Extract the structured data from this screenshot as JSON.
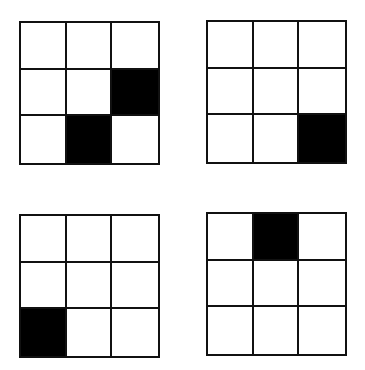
{
  "diagram": {
    "colors": {
      "filled": "#000000",
      "empty": "#ffffff",
      "line": "#111111"
    },
    "grids": [
      {
        "id": "top-left",
        "rows": 3,
        "cols": 3,
        "cells": [
          [
            0,
            0,
            0
          ],
          [
            0,
            0,
            1
          ],
          [
            0,
            1,
            0
          ]
        ]
      },
      {
        "id": "top-right",
        "rows": 3,
        "cols": 3,
        "cells": [
          [
            0,
            0,
            0
          ],
          [
            0,
            0,
            0
          ],
          [
            0,
            0,
            1
          ]
        ]
      },
      {
        "id": "bottom-left",
        "rows": 3,
        "cols": 3,
        "cells": [
          [
            0,
            0,
            0
          ],
          [
            0,
            0,
            0
          ],
          [
            1,
            0,
            0
          ]
        ]
      },
      {
        "id": "bottom-right",
        "rows": 3,
        "cols": 3,
        "cells": [
          [
            0,
            1,
            0
          ],
          [
            0,
            0,
            0
          ],
          [
            0,
            0,
            0
          ]
        ]
      }
    ]
  }
}
